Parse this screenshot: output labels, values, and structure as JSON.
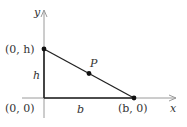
{
  "diagram": {
    "type": "right-triangle-coordinate-plot",
    "axes": {
      "x_label": "x",
      "y_label": "y",
      "axis_color": "#9a9a9a"
    },
    "points": [
      {
        "name": "top-vertex",
        "label": "(0, h)"
      },
      {
        "name": "origin",
        "label": "(0, 0)"
      },
      {
        "name": "right-vertex",
        "label": "(b, 0)"
      },
      {
        "name": "midpoint",
        "label": "P"
      }
    ],
    "sides": {
      "height_label": "h",
      "base_label": "b"
    },
    "line_color": "#222222"
  }
}
